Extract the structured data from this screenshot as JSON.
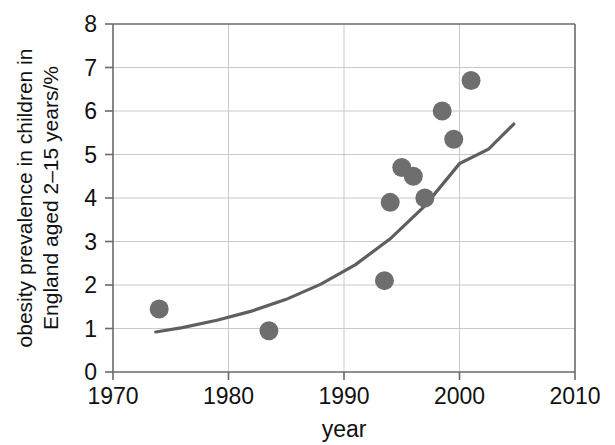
{
  "chart_data": {
    "type": "scatter",
    "title": "",
    "xlabel": "year",
    "ylabel": "obesity prevalence in children in England aged 2–15 years/%",
    "ylabel_lines": [
      "obesity prevalence in children in",
      "England aged 2–15 years/%"
    ],
    "xlim": [
      1970,
      2010
    ],
    "ylim": [
      0,
      8
    ],
    "xticks": [
      1970,
      1980,
      1990,
      2000,
      2010
    ],
    "xtick_labels": [
      "1970",
      "1980",
      "1990",
      "2000",
      "2010"
    ],
    "yticks": [
      0,
      1,
      2,
      3,
      4,
      5,
      6,
      7,
      8
    ],
    "ytick_labels": [
      "0",
      "1",
      "2",
      "3",
      "4",
      "5",
      "6",
      "7",
      "8"
    ],
    "grid": true,
    "grid_axes": "both",
    "legend": false,
    "marker_color": "#6e6e6e",
    "curve_color": "#5f5f5f",
    "grid_color": "#c9c9c9",
    "axis_color": "#6a6a6a",
    "series": [
      {
        "name": "obesity prevalence",
        "marker": "circle",
        "x": [
          1974.0,
          1983.5,
          1993.5,
          1994.0,
          1995.0,
          1996.0,
          1997.0,
          1998.5,
          1999.5,
          2001.0
        ],
        "y": [
          1.45,
          0.95,
          2.1,
          3.9,
          4.7,
          4.5,
          4.0,
          6.0,
          5.35,
          6.7
        ]
      }
    ],
    "fitted_curve": {
      "name": "exponential trend line",
      "x": [
        1973.7,
        1976.0,
        1979.0,
        1982.0,
        1985.0,
        1988.0,
        1991.0,
        1994.0,
        1997.0,
        2000.0,
        2002.5,
        2004.7
      ],
      "y": [
        0.92,
        1.02,
        1.19,
        1.4,
        1.67,
        2.02,
        2.47,
        3.06,
        3.82,
        4.79,
        5.12,
        5.7
      ]
    }
  }
}
